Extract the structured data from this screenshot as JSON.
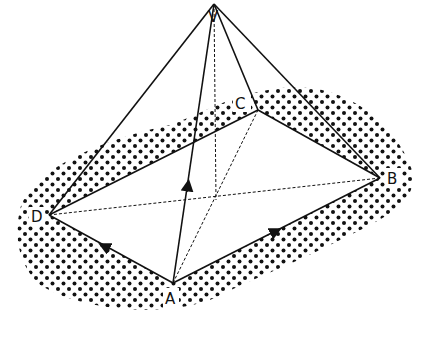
{
  "diagram": {
    "type": "pyramid-vector-diagram",
    "vertices": {
      "V": {
        "label": "V",
        "x": 214,
        "y": 4
      },
      "A": {
        "label": "A",
        "x": 173,
        "y": 283
      },
      "B": {
        "label": "B",
        "x": 380,
        "y": 178
      },
      "C": {
        "label": "C",
        "x": 258,
        "y": 110
      },
      "D": {
        "label": "D",
        "x": 49,
        "y": 215
      }
    },
    "solid_edges": [
      "VA",
      "VB",
      "VC",
      "VD",
      "AB",
      "AD",
      "DC",
      "CB"
    ],
    "dashed_edges": [
      "AC",
      "DB",
      "V-foot"
    ],
    "arrows": [
      "D-A (pointing to D)",
      "A-B (pointing to B)",
      "A-V (pointing to V)"
    ],
    "background": "dotted halftone blob",
    "colors": {
      "line": "#111111",
      "dots": "#111111",
      "background": "#ffffff"
    }
  }
}
